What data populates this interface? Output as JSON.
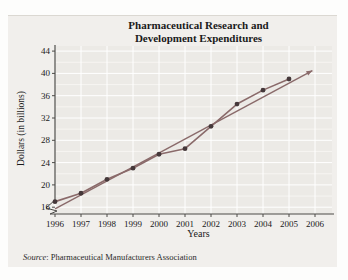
{
  "chart": {
    "title_line1": "Pharmaceutical Research and",
    "title_line2": "Development Expenditures",
    "xlabel": "Years",
    "ylabel": "Dollars (in billions)",
    "source_label": "Source",
    "source_text": ": Pharmaceutical Manufacturers Association"
  },
  "chart_data": {
    "type": "line",
    "title": "Pharmaceutical Research and Development Expenditures",
    "xlabel": "Years",
    "ylabel": "Dollars (in billions)",
    "source": "Source: Pharmaceutical Manufacturers Association",
    "x_ticks": [
      1996,
      1997,
      1998,
      1999,
      2000,
      2001,
      2002,
      2003,
      2004,
      2005,
      2006
    ],
    "y_ticks": [
      16,
      20,
      24,
      28,
      32,
      36,
      40,
      44
    ],
    "y_minor_step": 2,
    "xlim": [
      1996,
      2006.6
    ],
    "ylim": [
      14,
      45
    ],
    "grid": true,
    "y_axis_break": true,
    "legend": "none",
    "series": [
      {
        "name": "R&D expenditures (data points)",
        "style": "line-with-markers",
        "x": [
          1996,
          1997,
          1998,
          1999,
          2000,
          2001,
          2002,
          2003,
          2004,
          2005
        ],
        "y": [
          17,
          18.5,
          21,
          23,
          25.5,
          26.5,
          30.5,
          34.5,
          37,
          39
        ]
      },
      {
        "name": "trend line",
        "style": "straight-line-arrow-end",
        "x": [
          1996,
          2005.9
        ],
        "y": [
          15.7,
          40.5
        ]
      }
    ],
    "colors": {
      "series_line": "#8a6a6a",
      "marker": "#45383a",
      "trend_line": "#8a6a6a",
      "axis": "#4c4a47",
      "grid_major": "#ffffff",
      "grid_minor": "#f7f5f2",
      "tick_text": "#1a1a1a",
      "plot_bg": "#eceae6",
      "panel_bg": "#f1efec"
    }
  }
}
